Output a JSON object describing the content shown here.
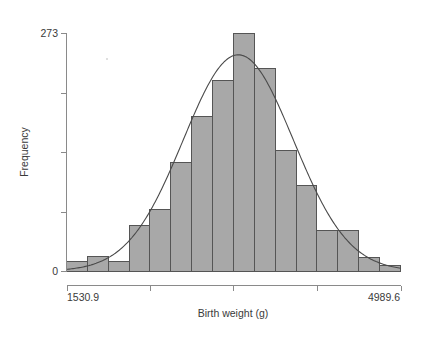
{
  "chart_data": {
    "type": "bar",
    "title": "",
    "subtitle": "",
    "xlabel": "Birth weight (g)",
    "ylabel": "Frequency",
    "xlim": [
      1530.9,
      4989.6
    ],
    "ylim": [
      0,
      273
    ],
    "grid": false,
    "legend": null,
    "x_tick_labels": [
      "1530.9",
      "",
      "",
      "",
      "4989.6"
    ],
    "x_tick_values": [
      1530.9,
      2395.5,
      3260.25,
      4125.0,
      4989.6
    ],
    "y_tick_labels": [
      "0",
      "",
      "",
      "",
      "273"
    ],
    "y_tick_values": [
      0,
      68.25,
      136.5,
      204.75,
      273
    ],
    "bin_edges": [
      1530.9,
      1747.0,
      1963.1,
      2179.3,
      2395.4,
      2611.5,
      2827.6,
      3043.7,
      3259.9,
      3476.0,
      3692.1,
      3908.2,
      4124.3,
      4340.5,
      4556.6,
      4772.7,
      4989.6
    ],
    "categories": [
      "1530.9-1747.0",
      "1747.0-1963.1",
      "1963.1-2179.3",
      "2179.3-2395.4",
      "2395.4-2611.5",
      "2611.5-2827.6",
      "2827.6-3043.7",
      "3043.7-3259.9",
      "3259.9-3476.0",
      "3476.0-3692.1",
      "3692.1-3908.2",
      "3908.2-4124.3",
      "4124.3-4340.5",
      "4340.5-4556.6",
      "4556.6-4772.7",
      "4772.7-4989.6"
    ],
    "values": [
      11,
      17,
      11,
      52,
      70,
      124,
      177,
      219,
      273,
      232,
      138,
      98,
      47,
      47,
      16,
      6
    ],
    "series": [
      {
        "name": "Frequency",
        "values": [
          11,
          17,
          11,
          52,
          70,
          124,
          177,
          219,
          273,
          232,
          138,
          98,
          47,
          47,
          16,
          6
        ]
      }
    ],
    "overlay": {
      "type": "line",
      "name": "Normal density curve",
      "mean": 3310,
      "sd": 570,
      "peak_value": 248
    },
    "colors": {
      "bar_fill": "#a8a8a8",
      "bar_stroke": "#555555",
      "curve": "#4a4a4a",
      "axis": "#8a8a8a",
      "text": "#3a3a3a"
    }
  },
  "axes": {
    "y_max_label": "273",
    "y_min_label": "0",
    "y_title": "Frequency",
    "x_min_label": "1530.9",
    "x_max_label": "4989.6",
    "x_title": "Birth weight (g)"
  }
}
